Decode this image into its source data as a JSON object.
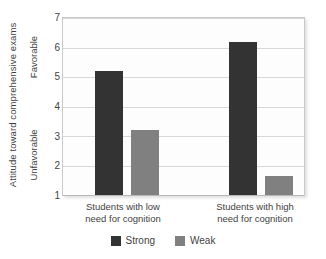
{
  "chart_data": {
    "type": "bar",
    "title": "",
    "xlabel": "",
    "ylabel": "Attitude toward comprehensive exams",
    "y_anchor_high": "Favorable",
    "y_anchor_low": "Unfavorable",
    "ylim": [
      1,
      7
    ],
    "yticks": [
      7,
      6,
      5,
      4,
      3,
      2,
      1
    ],
    "grid": true,
    "legend_position": "bottom",
    "categories": [
      "Students with low need for cognition",
      "Students with high need for cognition"
    ],
    "category_lines": [
      [
        "Students with low",
        "need for cognition"
      ],
      [
        "Students with high",
        "need for cognition"
      ]
    ],
    "series": [
      {
        "name": "Strong",
        "color": "#333333",
        "values": [
          5.2,
          6.2
        ]
      },
      {
        "name": "Weak",
        "color": "#808080",
        "values": [
          3.2,
          1.65
        ]
      }
    ]
  },
  "legend": {
    "items": [
      {
        "label": "Strong",
        "color": "#333333"
      },
      {
        "label": "Weak",
        "color": "#808080"
      }
    ]
  },
  "axis": {
    "tick_7": "7",
    "tick_6": "6",
    "tick_5": "5",
    "tick_4": "4",
    "tick_3": "3",
    "tick_2": "2",
    "tick_1": "1"
  }
}
